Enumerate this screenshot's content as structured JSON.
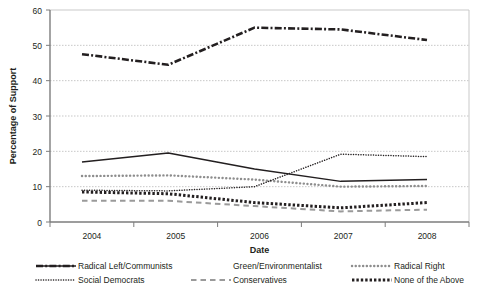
{
  "chart_data": {
    "type": "line",
    "title": "",
    "xlabel": "Date",
    "ylabel": "Percentage of Support",
    "x": [
      "2004",
      "2005",
      "2006",
      "2007",
      "2008"
    ],
    "categories": [
      "2004",
      "2005",
      "2006",
      "2007",
      "2008"
    ],
    "xlim": [
      2004,
      2008
    ],
    "ylim": [
      0,
      60
    ],
    "yticks": [
      0,
      10,
      20,
      30,
      40,
      50,
      60
    ],
    "ytick_labels": [
      "0",
      "10",
      "20",
      "30",
      "40",
      "50",
      "60"
    ],
    "grid": "horizontal-dotted",
    "legend_position": "bottom",
    "series": [
      {
        "name": "Radical Left/Communists",
        "style": "solid",
        "color": "#231f20",
        "values": [
          17.0,
          19.5,
          15.0,
          11.5,
          12.0
        ]
      },
      {
        "name": "Social Democrats",
        "style": "dash-dot",
        "color": "#231f20",
        "values": [
          47.5,
          44.5,
          55.0,
          54.5,
          51.5
        ]
      },
      {
        "name": "Green/Environmentalist",
        "style": "round-dotted",
        "color": "#8d8d8d",
        "values": [
          13.0,
          13.2,
          12.0,
          10.0,
          10.2
        ]
      },
      {
        "name": "Conservatives",
        "style": "fine-dotted",
        "color": "#231f20",
        "values": [
          9.0,
          8.8,
          10.0,
          19.2,
          18.5
        ]
      },
      {
        "name": "Radical Right",
        "style": "long-dash",
        "color": "#9a9a9a",
        "values": [
          6.0,
          6.0,
          4.5,
          3.0,
          3.5
        ]
      },
      {
        "name": "None of the Above",
        "style": "square-dotted",
        "color": "#231f20",
        "values": [
          8.5,
          8.0,
          5.5,
          4.0,
          5.5
        ]
      }
    ]
  },
  "axes": {
    "ylabel": "Percentage of Support",
    "xlabel": "Date",
    "ytick_labels": [
      "60",
      "50",
      "40",
      "30",
      "20",
      "10",
      "0"
    ],
    "xtick_labels": [
      "2004",
      "2005",
      "2006",
      "2007",
      "2008"
    ]
  },
  "legend": {
    "entries": [
      {
        "label": "Radical Left/Communists",
        "swatch": "solid-line-swatch"
      },
      {
        "label": "Green/Environmentalist",
        "swatch": "round-dotted-line-swatch"
      },
      {
        "label": "Radical Right",
        "swatch": "long-dash-line-swatch"
      },
      {
        "label": "Social Democrats",
        "swatch": "dash-dot-line-swatch"
      },
      {
        "label": "Conservatives",
        "swatch": "fine-dotted-line-swatch"
      },
      {
        "label": "None of the Above",
        "swatch": "square-dotted-line-swatch"
      }
    ]
  },
  "colors": {
    "ink": "#231f20",
    "grid": "#b9b9b9",
    "axis": "#7d7d7d",
    "grey_series": "#8d8d8d"
  }
}
